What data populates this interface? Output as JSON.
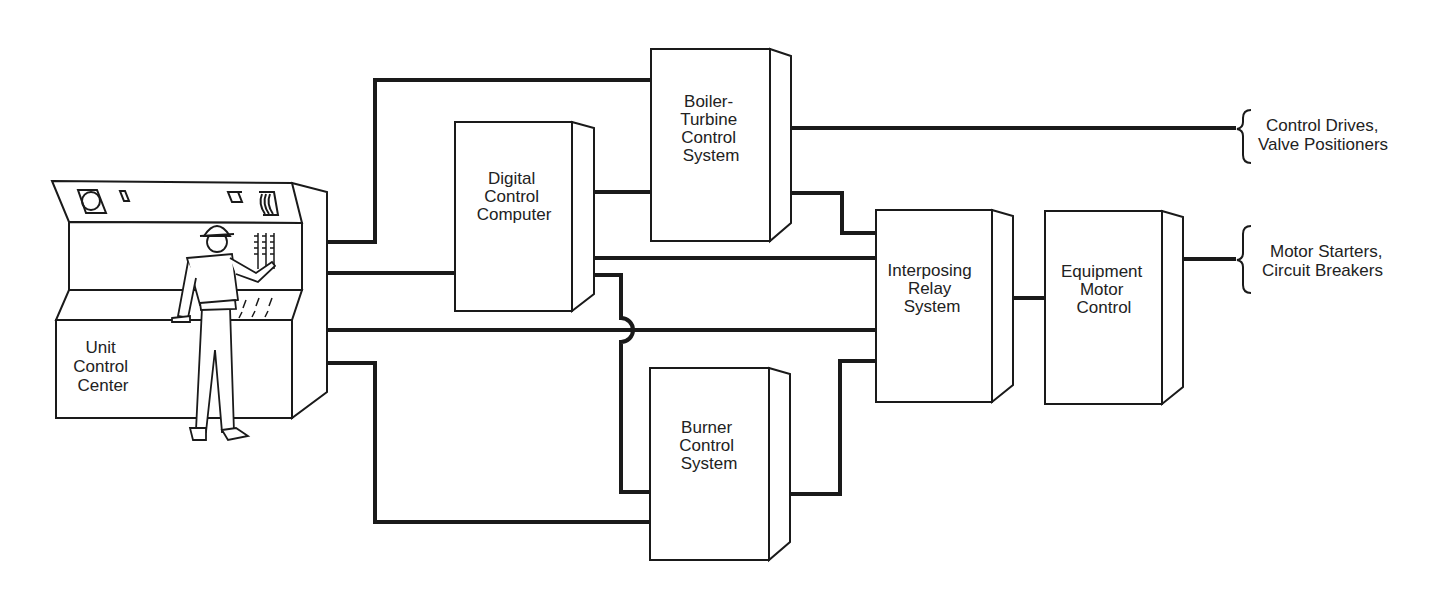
{
  "diagram": {
    "type": "block-diagram",
    "nodes": {
      "unit_control_center": {
        "lines": [
          "Unit",
          "Control",
          "Center"
        ]
      },
      "digital_control_computer": {
        "lines": [
          "Digital",
          "Control",
          "Computer"
        ]
      },
      "boiler_turbine": {
        "lines": [
          "Boiler-",
          "Turbine",
          "Control",
          "System"
        ]
      },
      "interposing_relay": {
        "lines": [
          "Interposing",
          "Relay",
          "System"
        ]
      },
      "equipment_motor_control": {
        "lines": [
          "Equipment",
          "Motor",
          "Control"
        ]
      },
      "burner_control": {
        "lines": [
          "Burner",
          "Control",
          "System"
        ]
      }
    },
    "outputs": {
      "control_drives": {
        "lines": [
          "Control Drives,",
          "Valve Positioners"
        ]
      },
      "motor_starters": {
        "lines": [
          "Motor Starters,",
          "Circuit Breakers"
        ]
      }
    },
    "connections": [
      {
        "from": "Unit Control Center",
        "to": "Boiler-Turbine Control System"
      },
      {
        "from": "Unit Control Center",
        "to": "Digital Control Computer"
      },
      {
        "from": "Unit Control Center",
        "to": "Interposing Relay System"
      },
      {
        "from": "Unit Control Center",
        "to": "Burner Control System"
      },
      {
        "from": "Digital Control Computer",
        "to": "Boiler-Turbine Control System"
      },
      {
        "from": "Digital Control Computer",
        "to": "Interposing Relay System"
      },
      {
        "from": "Digital Control Computer",
        "to": "Burner Control System"
      },
      {
        "from": "Boiler-Turbine Control System",
        "to": "Control Drives, Valve Positioners"
      },
      {
        "from": "Boiler-Turbine Control System",
        "to": "Interposing Relay System"
      },
      {
        "from": "Burner Control System",
        "to": "Interposing Relay System"
      },
      {
        "from": "Interposing Relay System",
        "to": "Equipment Motor Control"
      },
      {
        "from": "Equipment Motor Control",
        "to": "Motor Starters, Circuit Breakers"
      }
    ]
  }
}
